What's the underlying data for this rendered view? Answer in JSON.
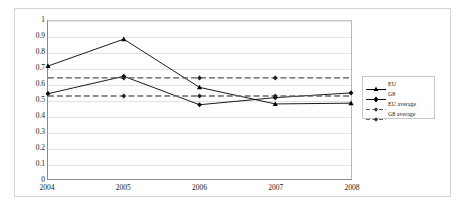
{
  "chart_data": {
    "type": "line",
    "title": "",
    "subtitle": "",
    "xlabel": "",
    "ylabel": "",
    "categories": [
      "2004",
      "2005",
      "2006",
      "2007",
      "2008"
    ],
    "x": [
      2004,
      2005,
      2006,
      2007,
      2008
    ],
    "ylim": [
      0,
      1
    ],
    "xlim": [
      2004,
      2008
    ],
    "yticks": [
      "0",
      "0.1",
      "0.2",
      "0.3",
      "0.4",
      "0.5",
      "0.6",
      "0.7",
      "0.8",
      "0.9",
      "1"
    ],
    "ytick_values": [
      0,
      0.1,
      0.2,
      0.3,
      0.4,
      0.5,
      0.6,
      0.7,
      0.8,
      0.9,
      1
    ],
    "grid": "horizontal",
    "legend_position": "right",
    "series": [
      {
        "name": "EU",
        "marker": "triangle",
        "style": "solid",
        "color": "#000000",
        "values": [
          0.715,
          0.885,
          0.58,
          0.475,
          0.48
        ]
      },
      {
        "name": "G8",
        "marker": "diamond",
        "style": "solid",
        "color": "#000000",
        "values": [
          0.54,
          0.65,
          0.47,
          0.515,
          0.545
        ]
      },
      {
        "name": "EU average",
        "marker": "diamond",
        "style": "dashed",
        "color": "#555555",
        "values": [
          0.64,
          0.64,
          0.64,
          0.64,
          0.64
        ]
      },
      {
        "name": "G8 average",
        "marker": "diamond",
        "style": "dashed",
        "color": "#666666",
        "values": [
          0.525,
          0.525,
          0.525,
          0.525,
          0.525
        ]
      }
    ]
  },
  "legend": {
    "items": [
      {
        "label": "EU"
      },
      {
        "label": "G8"
      },
      {
        "label": "EU average"
      },
      {
        "label": "G8 average"
      }
    ]
  },
  "colors": {
    "series_line": "#000000",
    "average_line": "#5a5a5a",
    "gridline": "#e2e2e2",
    "axis": "#8a8a8a",
    "frame": "#d4d4d4",
    "text": "#1a1a1a"
  }
}
